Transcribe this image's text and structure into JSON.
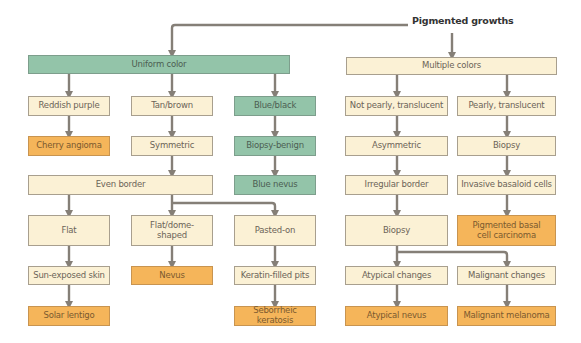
{
  "title": "Pigmented growths",
  "colors": {
    "decision_box": "#fbf1d5",
    "category_box": "#93c4a9",
    "diagnosis_box": "#f5b55a",
    "connector": "#857f77"
  },
  "branches": {
    "uniform": {
      "label": "Uniform color",
      "reddish": {
        "label": "Reddish purple",
        "diagnosis": "Cherry angioma"
      },
      "tan": {
        "label": "Tan/brown",
        "symmetric": "Symmetric",
        "even_border": "Even border",
        "flat": {
          "label": "Flat",
          "next": "Sun-exposed skin",
          "diagnosis": "Solar lentigo"
        },
        "dome": {
          "label": "Flat/dome-shaped",
          "diagnosis": "Nevus"
        },
        "pasted": {
          "label": "Pasted-on",
          "next": "Keratin-filled pits",
          "diagnosis": "Seborrheic keratosis"
        }
      },
      "blue": {
        "label": "Blue/black",
        "next": "Biopsy-benign",
        "diagnosis": "Blue nevus"
      }
    },
    "multiple": {
      "label": "Multiple colors",
      "not_pearly": {
        "label": "Not pearly, translucent",
        "asymmetric": "Asymmetric",
        "irregular": "Irregular border",
        "biopsy": "Biopsy",
        "atypical": {
          "label": "Atypical changes",
          "diagnosis": "Atypical nevus"
        },
        "malignant": {
          "label": "Malignant changes",
          "diagnosis": "Malignant melanoma"
        }
      },
      "pearly": {
        "label": "Pearly, translucent",
        "biopsy": "Biopsy",
        "cells": "Invasive basaloid cells",
        "diagnosis": "Pigmented basal cell carcinoma"
      }
    }
  }
}
